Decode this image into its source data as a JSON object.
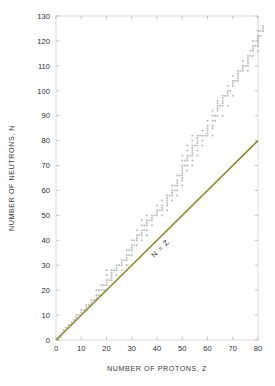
{
  "chart_data": {
    "type": "scatter",
    "title": "",
    "xlabel": "NUMBER OF PROTONS, Z",
    "ylabel": "NUMBER OF NEUTRONS, N",
    "xlim": [
      0,
      80
    ],
    "ylim": [
      0,
      130
    ],
    "xticks": [
      0,
      10,
      20,
      30,
      40,
      50,
      60,
      70,
      80
    ],
    "yticks": [
      0,
      10,
      20,
      30,
      40,
      50,
      60,
      70,
      80,
      90,
      100,
      110,
      120,
      130
    ],
    "grid": false,
    "legend": null,
    "annotations": [
      {
        "text": "N = Z",
        "x": 42,
        "y": 36,
        "rotation": -45,
        "color": "#7f8027"
      }
    ],
    "series": [
      {
        "name": "N = Z reference line",
        "type": "line",
        "color": "#8a8a2a",
        "x": [
          0,
          80
        ],
        "values": [
          0,
          80
        ]
      },
      {
        "name": "Stable nuclides",
        "type": "scatter",
        "color": "#9a9a9a",
        "marker": "square",
        "points": [
          [
            1,
            0
          ],
          [
            1,
            1
          ],
          [
            2,
            1
          ],
          [
            2,
            2
          ],
          [
            3,
            3
          ],
          [
            3,
            4
          ],
          [
            4,
            5
          ],
          [
            5,
            5
          ],
          [
            5,
            6
          ],
          [
            6,
            6
          ],
          [
            6,
            7
          ],
          [
            7,
            7
          ],
          [
            7,
            8
          ],
          [
            8,
            8
          ],
          [
            8,
            9
          ],
          [
            8,
            10
          ],
          [
            9,
            10
          ],
          [
            10,
            10
          ],
          [
            10,
            11
          ],
          [
            10,
            12
          ],
          [
            11,
            12
          ],
          [
            12,
            12
          ],
          [
            12,
            13
          ],
          [
            12,
            14
          ],
          [
            13,
            14
          ],
          [
            14,
            14
          ],
          [
            14,
            15
          ],
          [
            14,
            16
          ],
          [
            15,
            16
          ],
          [
            16,
            16
          ],
          [
            16,
            17
          ],
          [
            16,
            18
          ],
          [
            16,
            20
          ],
          [
            17,
            18
          ],
          [
            17,
            20
          ],
          [
            18,
            18
          ],
          [
            18,
            20
          ],
          [
            18,
            22
          ],
          [
            19,
            20
          ],
          [
            19,
            22
          ],
          [
            20,
            20
          ],
          [
            20,
            22
          ],
          [
            20,
            23
          ],
          [
            20,
            24
          ],
          [
            20,
            26
          ],
          [
            20,
            28
          ],
          [
            21,
            24
          ],
          [
            22,
            24
          ],
          [
            22,
            25
          ],
          [
            22,
            26
          ],
          [
            22,
            27
          ],
          [
            22,
            28
          ],
          [
            23,
            28
          ],
          [
            24,
            26
          ],
          [
            24,
            28
          ],
          [
            24,
            29
          ],
          [
            24,
            30
          ],
          [
            25,
            30
          ],
          [
            26,
            28
          ],
          [
            26,
            30
          ],
          [
            26,
            31
          ],
          [
            26,
            32
          ],
          [
            27,
            32
          ],
          [
            28,
            30
          ],
          [
            28,
            32
          ],
          [
            28,
            33
          ],
          [
            28,
            34
          ],
          [
            28,
            36
          ],
          [
            29,
            34
          ],
          [
            29,
            36
          ],
          [
            30,
            34
          ],
          [
            30,
            36
          ],
          [
            30,
            37
          ],
          [
            30,
            38
          ],
          [
            30,
            40
          ],
          [
            31,
            38
          ],
          [
            31,
            40
          ],
          [
            32,
            38
          ],
          [
            32,
            40
          ],
          [
            32,
            41
          ],
          [
            32,
            42
          ],
          [
            32,
            44
          ],
          [
            33,
            42
          ],
          [
            34,
            40
          ],
          [
            34,
            42
          ],
          [
            34,
            43
          ],
          [
            34,
            44
          ],
          [
            34,
            46
          ],
          [
            34,
            48
          ],
          [
            35,
            44
          ],
          [
            35,
            46
          ],
          [
            36,
            42
          ],
          [
            36,
            44
          ],
          [
            36,
            46
          ],
          [
            36,
            47
          ],
          [
            36,
            48
          ],
          [
            36,
            50
          ],
          [
            37,
            48
          ],
          [
            38,
            46
          ],
          [
            38,
            48
          ],
          [
            38,
            49
          ],
          [
            38,
            50
          ],
          [
            39,
            50
          ],
          [
            40,
            50
          ],
          [
            40,
            51
          ],
          [
            40,
            52
          ],
          [
            40,
            54
          ],
          [
            41,
            52
          ],
          [
            42,
            50
          ],
          [
            42,
            52
          ],
          [
            42,
            53
          ],
          [
            42,
            54
          ],
          [
            42,
            56
          ],
          [
            44,
            52
          ],
          [
            44,
            54
          ],
          [
            44,
            55
          ],
          [
            44,
            56
          ],
          [
            44,
            57
          ],
          [
            44,
            58
          ],
          [
            45,
            58
          ],
          [
            46,
            56
          ],
          [
            46,
            58
          ],
          [
            46,
            59
          ],
          [
            46,
            60
          ],
          [
            46,
            62
          ],
          [
            47,
            60
          ],
          [
            47,
            62
          ],
          [
            48,
            58
          ],
          [
            48,
            60
          ],
          [
            48,
            62
          ],
          [
            48,
            63
          ],
          [
            48,
            64
          ],
          [
            48,
            66
          ],
          [
            49,
            66
          ],
          [
            50,
            62
          ],
          [
            50,
            64
          ],
          [
            50,
            65
          ],
          [
            50,
            66
          ],
          [
            50,
            67
          ],
          [
            50,
            68
          ],
          [
            50,
            69
          ],
          [
            50,
            70
          ],
          [
            50,
            72
          ],
          [
            50,
            74
          ],
          [
            51,
            70
          ],
          [
            51,
            72
          ],
          [
            52,
            68
          ],
          [
            52,
            70
          ],
          [
            52,
            72
          ],
          [
            52,
            73
          ],
          [
            52,
            74
          ],
          [
            52,
            76
          ],
          [
            52,
            78
          ],
          [
            53,
            74
          ],
          [
            54,
            70
          ],
          [
            54,
            72
          ],
          [
            54,
            74
          ],
          [
            54,
            75
          ],
          [
            54,
            76
          ],
          [
            54,
            77
          ],
          [
            54,
            78
          ],
          [
            54,
            80
          ],
          [
            54,
            82
          ],
          [
            55,
            78
          ],
          [
            56,
            74
          ],
          [
            56,
            76
          ],
          [
            56,
            78
          ],
          [
            56,
            79
          ],
          [
            56,
            80
          ],
          [
            56,
            81
          ],
          [
            56,
            82
          ],
          [
            57,
            82
          ],
          [
            58,
            78
          ],
          [
            58,
            80
          ],
          [
            58,
            82
          ],
          [
            58,
            84
          ],
          [
            59,
            82
          ],
          [
            60,
            82
          ],
          [
            60,
            83
          ],
          [
            60,
            84
          ],
          [
            60,
            85
          ],
          [
            60,
            86
          ],
          [
            60,
            88
          ],
          [
            62,
            82
          ],
          [
            62,
            85
          ],
          [
            62,
            86
          ],
          [
            62,
            88
          ],
          [
            62,
            90
          ],
          [
            62,
            92
          ],
          [
            63,
            88
          ],
          [
            63,
            90
          ],
          [
            64,
            90
          ],
          [
            64,
            92
          ],
          [
            64,
            93
          ],
          [
            64,
            94
          ],
          [
            64,
            95
          ],
          [
            64,
            96
          ],
          [
            65,
            94
          ],
          [
            66,
            90
          ],
          [
            66,
            94
          ],
          [
            66,
            95
          ],
          [
            66,
            96
          ],
          [
            66,
            97
          ],
          [
            66,
            98
          ],
          [
            67,
            98
          ],
          [
            68,
            94
          ],
          [
            68,
            98
          ],
          [
            68,
            99
          ],
          [
            68,
            100
          ],
          [
            68,
            102
          ],
          [
            69,
            100
          ],
          [
            70,
            98
          ],
          [
            70,
            102
          ],
          [
            70,
            103
          ],
          [
            70,
            104
          ],
          [
            70,
            106
          ],
          [
            71,
            104
          ],
          [
            72,
            104
          ],
          [
            72,
            105
          ],
          [
            72,
            106
          ],
          [
            72,
            107
          ],
          [
            72,
            108
          ],
          [
            73,
            108
          ],
          [
            74,
            108
          ],
          [
            74,
            109
          ],
          [
            74,
            110
          ],
          [
            74,
            112
          ],
          [
            75,
            110
          ],
          [
            76,
            108
          ],
          [
            76,
            110
          ],
          [
            76,
            111
          ],
          [
            76,
            112
          ],
          [
            76,
            113
          ],
          [
            76,
            114
          ],
          [
            77,
            114
          ],
          [
            77,
            116
          ],
          [
            78,
            114
          ],
          [
            78,
            116
          ],
          [
            78,
            117
          ],
          [
            78,
            118
          ],
          [
            78,
            120
          ],
          [
            79,
            118
          ],
          [
            80,
            116
          ],
          [
            80,
            118
          ],
          [
            80,
            119
          ],
          [
            80,
            120
          ],
          [
            80,
            121
          ],
          [
            80,
            122
          ],
          [
            80,
            124
          ],
          [
            81,
            122
          ],
          [
            81,
            124
          ],
          [
            82,
            124
          ],
          [
            82,
            125
          ],
          [
            82,
            126
          ]
        ]
      }
    ]
  },
  "axes": {
    "x_title": "NUMBER OF PROTONS, Z",
    "y_title": "NUMBER OF NEUTRONS, N"
  }
}
